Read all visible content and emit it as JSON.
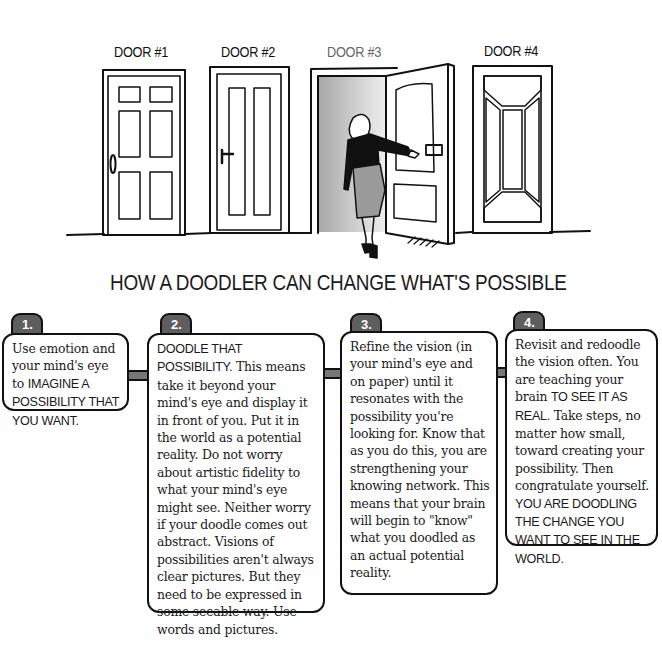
{
  "doors": [
    {
      "label": "DOOR #1",
      "style": "six-panel",
      "state": "closed",
      "handle": "knob"
    },
    {
      "label": "DOOR #2",
      "style": "two-tall-panel",
      "state": "closed",
      "handle": "lever"
    },
    {
      "label": "DOOR #3",
      "style": "arched-panel",
      "state": "open",
      "handle": "lever"
    },
    {
      "label": "DOOR #4",
      "style": "framed-diamond-panel",
      "state": "closed",
      "handle": "none"
    }
  ],
  "figure": {
    "colors": {
      "top": "#111111",
      "skirt": "#9a9a9a"
    }
  },
  "headline": "HOW A DOODLER CAN CHANGE WHAT'S POSSIBLE",
  "colors": {
    "tab": "#5e5e5e",
    "connector": "#777777",
    "ink": "#111111",
    "doorway_shadow": "#b5b5b5"
  },
  "steps": [
    {
      "number": "1.",
      "parts": [
        {
          "text": "Use emotion and your mind's eye to ",
          "caps": false
        },
        {
          "text": "IMAGINE A POSSIBILITY THAT YOU WANT.",
          "caps": true
        }
      ]
    },
    {
      "number": "2.",
      "parts": [
        {
          "text": "DOODLE THAT POSSIBILITY.",
          "caps": true
        },
        {
          "text": " This means take it beyond your mind's eye and display it in front of you. Put it in the world as a potential reality. Do not worry about artistic fidelity to what your mind's eye might see. Neither worry if your doodle comes out abstract. Visions of possibilities aren't always clear pictures. But they need to be expressed in some seeable way. Use words and pictures.",
          "caps": false
        }
      ]
    },
    {
      "number": "3.",
      "parts": [
        {
          "text": "Refine the vision (in your mind's eye and on paper) until it resonates with the possibility you're looking for. Know that as you do this, you are strengthening your knowing network. This means that your brain will begin to \"know\" what you doodled as an actual potential reality.",
          "caps": false
        }
      ]
    },
    {
      "number": "4.",
      "parts": [
        {
          "text": "Revisit and redoodle the vision often. You are teaching your brain ",
          "caps": false
        },
        {
          "text": "TO SEE IT AS REAL.",
          "caps": true
        },
        {
          "text": " Take steps, no matter how small, toward creating your possibility. Then congratulate yourself. ",
          "caps": false
        },
        {
          "text": "YOU ARE DOODLING THE CHANGE YOU WANT TO SEE IN THE WORLD.",
          "caps": true
        }
      ]
    }
  ]
}
